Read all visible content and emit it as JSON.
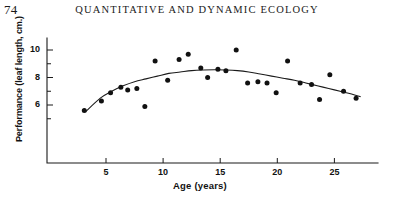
{
  "page": {
    "number": "74",
    "running_head": "QUANTITATIVE AND DYNAMIC ECOLOGY"
  },
  "chart_data": {
    "type": "scatter",
    "title": "",
    "xlabel": "Age  (years)",
    "ylabel": "Performance (leaf  length, cm.)",
    "xlim": [
      0,
      29
    ],
    "ylim": [
      4.5,
      11.2
    ],
    "xticks": [
      5,
      10,
      15,
      20,
      25
    ],
    "xtick_labels": [
      "5",
      "10",
      "15",
      "20",
      "25"
    ],
    "yticks": [
      6,
      8,
      10
    ],
    "ytick_labels": [
      "6",
      "8",
      "10"
    ],
    "yminor_ticks": [
      5,
      7,
      9,
      11
    ],
    "grid": false,
    "legend": null,
    "series": [
      {
        "name": "observations",
        "marker": "filled-circle",
        "color": "#111111",
        "points": [
          [
            3.1,
            5.6
          ],
          [
            4.6,
            6.3
          ],
          [
            5.4,
            6.9
          ],
          [
            6.3,
            7.3
          ],
          [
            6.9,
            7.1
          ],
          [
            7.7,
            7.2
          ],
          [
            8.4,
            5.9
          ],
          [
            9.3,
            9.2
          ],
          [
            10.4,
            7.8
          ],
          [
            11.4,
            9.3
          ],
          [
            12.2,
            9.7
          ],
          [
            13.3,
            8.7
          ],
          [
            13.9,
            8.0
          ],
          [
            14.8,
            8.6
          ],
          [
            15.5,
            8.5
          ],
          [
            16.4,
            10.0
          ],
          [
            17.4,
            7.6
          ],
          [
            18.3,
            7.7
          ],
          [
            19.1,
            7.6
          ],
          [
            19.9,
            6.9
          ],
          [
            20.9,
            9.2
          ],
          [
            22.0,
            7.6
          ],
          [
            23.0,
            7.5
          ],
          [
            23.7,
            6.4
          ],
          [
            24.6,
            8.2
          ],
          [
            25.8,
            7.0
          ],
          [
            26.9,
            6.5
          ]
        ]
      }
    ],
    "fit_curve": {
      "name": "fitted quadratic trend",
      "color": "#1a1a1a",
      "points": [
        [
          3.2,
          5.5
        ],
        [
          4.5,
          6.5
        ],
        [
          5.5,
          7.0
        ],
        [
          6.5,
          7.4
        ],
        [
          7.5,
          7.7
        ],
        [
          8.5,
          7.9
        ],
        [
          9.5,
          8.1
        ],
        [
          10.5,
          8.3
        ],
        [
          11.5,
          8.4
        ],
        [
          12.5,
          8.5
        ],
        [
          13.5,
          8.55
        ],
        [
          14.5,
          8.57
        ],
        [
          15.5,
          8.55
        ],
        [
          16.5,
          8.5
        ],
        [
          17.5,
          8.4
        ],
        [
          18.5,
          8.25
        ],
        [
          19.5,
          8.1
        ],
        [
          20.5,
          7.95
        ],
        [
          21.5,
          7.8
        ],
        [
          22.5,
          7.6
        ],
        [
          23.5,
          7.4
        ],
        [
          24.5,
          7.2
        ],
        [
          25.5,
          7.0
        ],
        [
          26.5,
          6.8
        ],
        [
          27.3,
          6.6
        ]
      ]
    }
  }
}
